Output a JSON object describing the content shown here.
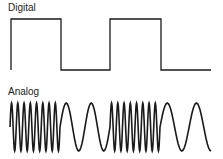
{
  "labels": {
    "digital": "Digital",
    "analog": "Analog"
  },
  "colors": {
    "stroke": "#1a1a1a",
    "background": "#ffffff"
  },
  "digital_signal": {
    "x_start": 11,
    "x_end": 211,
    "high_y": 19,
    "low_y": 70,
    "transitions_x": [
      61,
      110,
      161
    ],
    "levels": [
      "high",
      "low",
      "high",
      "low"
    ]
  },
  "analog_signal": {
    "x_start": 10,
    "x_end": 211,
    "mid_y": 127,
    "amplitude": 24,
    "segments": [
      {
        "type": "high-frequency",
        "x_from": 10,
        "x_to": 60,
        "cycles": 8
      },
      {
        "type": "low-frequency",
        "x_from": 60,
        "x_to": 110,
        "cycles": 2
      },
      {
        "type": "high-frequency",
        "x_from": 110,
        "x_to": 160,
        "cycles": 8
      },
      {
        "type": "low-frequency",
        "x_from": 160,
        "x_to": 211,
        "cycles": 1.75
      }
    ]
  }
}
